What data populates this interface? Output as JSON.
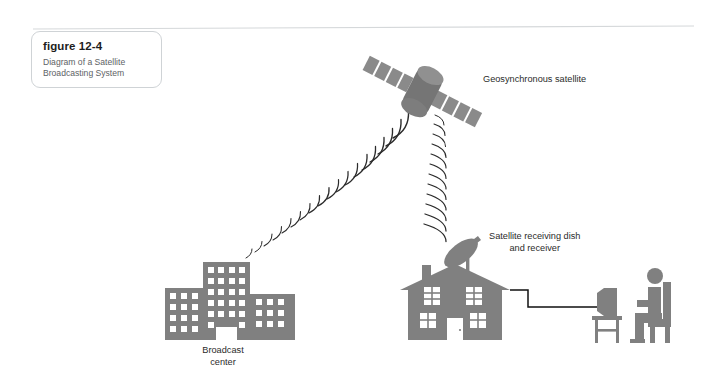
{
  "figure": {
    "label_word": "figure",
    "number": "12-4",
    "description_line1": "Diagram of a Satellite",
    "description_line2": "Broadcasting System"
  },
  "labels": {
    "satellite": "Geosynchronous satellite",
    "dish_line1": "Satellite receiving dish",
    "dish_line2": "and receiver",
    "broadcast_line1": "Broadcast",
    "broadcast_line2": "center"
  },
  "colors": {
    "figure_gray": "#808080",
    "wave_stroke": "#2b2b2b",
    "cable_stroke": "#111111",
    "rule_stroke": "#d5d8da",
    "card_border": "#cfd3d6",
    "text_dark": "#1d1d1d",
    "text_muted": "#5d6265",
    "background": "#ffffff"
  },
  "elements": {
    "broadcast_center": "three office buildings with window grid",
    "geosynchronous_satellite": "cylindrical satellite body with two solar panel wings",
    "uplink_signal": "arc wave train from broadcast center to satellite",
    "downlink_signal": "arc wave train from satellite to receiving dish",
    "house": "single family house with chimney, roof, four windows and a door",
    "receiving_dish": "parabolic satellite dish on the house roof",
    "cable": "coaxial cable from receiver to television",
    "television": "television set on a small stand",
    "viewer": "person seated in a chair watching television"
  }
}
